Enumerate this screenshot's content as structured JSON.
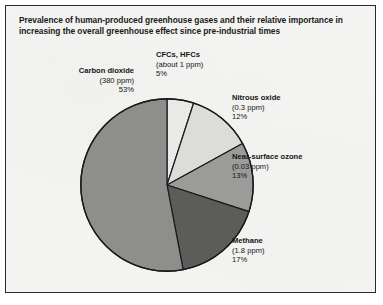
{
  "chart_data": {
    "type": "pie",
    "title": "Prevalence of human-produced greenhouse gases and their relative importance in increasing the overall greenhouse effect since pre-industrial times",
    "categories": [
      "Carbon dioxide",
      "CFCs, HFCs",
      "Nitrous oxide",
      "Near-surface ozone",
      "Methane"
    ],
    "values": [
      53,
      12,
      13,
      17,
      5
    ],
    "value_unit": "%",
    "start_angle_deg": 0,
    "direction": "clockwise",
    "legend": "none",
    "grid": false,
    "slices": [
      {
        "name": "CFCs, HFCs",
        "concentration": "(about 1 ppm)",
        "percent": "5%",
        "value": 5,
        "color": "#e9e9e7",
        "order": 1
      },
      {
        "name": "Nitrous oxide",
        "concentration": "(0.3 ppm)",
        "percent": "12%",
        "value": 12,
        "color": "#dcdcda",
        "order": 2
      },
      {
        "name": "Near-surface ozone",
        "concentration": "(0.03 ppm)",
        "percent": "13%",
        "value": 13,
        "color": "#9b9b99",
        "order": 3
      },
      {
        "name": "Methane",
        "concentration": "(1.8 ppm)",
        "percent": "17%",
        "value": 17,
        "color": "#5c5c5a",
        "order": 4
      },
      {
        "name": "Carbon dioxide",
        "concentration": "(380 ppm)",
        "percent": "53%",
        "value": 53,
        "color": "#8e8e8c",
        "order": 5
      }
    ],
    "xlabel": "",
    "ylabel": ""
  },
  "colors": {
    "panel_background": "#f4f4f2",
    "panel_border": "#2b2b2b",
    "slice_outline": "#1a1a1a",
    "text": "#151515",
    "title_text": "#1b1b1b"
  },
  "labels": {
    "carbon_dioxide": {
      "name": "Carbon dioxide",
      "concentration": "(380 ppm)",
      "percent": "53%"
    },
    "cfcs_hfcs": {
      "name": "CFCs, HFCs",
      "concentration": "(about 1 ppm)",
      "percent": "5%"
    },
    "nitrous_oxide": {
      "name": "Nitrous oxide",
      "concentration": "(0.3 ppm)",
      "percent": "12%"
    },
    "near_surface_ozone": {
      "name": "Near-surface ozone",
      "concentration": "(0.03 ppm)",
      "percent": "13%"
    },
    "methane": {
      "name": "Methane",
      "concentration": "(1.8 ppm)",
      "percent": "17%"
    }
  }
}
